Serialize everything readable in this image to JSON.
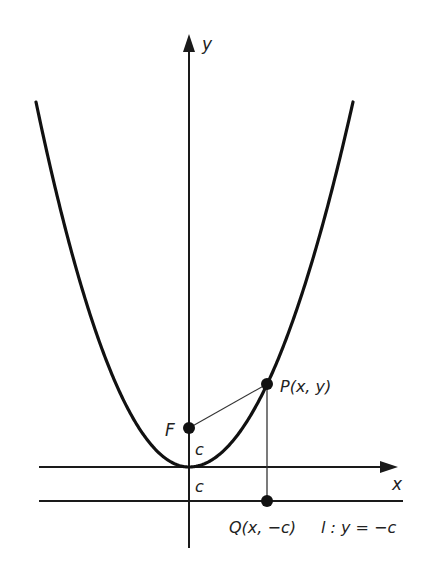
{
  "figure": {
    "axes": {
      "x_label": "x",
      "y_label": "y"
    },
    "points": {
      "focus": {
        "label": "F",
        "distance_label": "c"
      },
      "point_on_curve": {
        "label": "P(x, y)"
      },
      "projection": {
        "label": "Q(x, −c)"
      }
    },
    "directrix": {
      "label": "l : y = −c",
      "distance_label": "c"
    },
    "colors": {
      "stroke": "#1a1a1a",
      "background": "#ffffff"
    }
  }
}
